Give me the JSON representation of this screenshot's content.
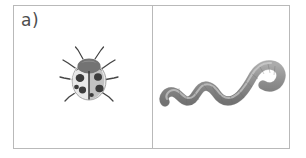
{
  "figure": {
    "label": "a)",
    "background_color": "#ffffff",
    "border_color": "#b9b9b9",
    "label_color": "#4d4d4d"
  },
  "cells": [
    {
      "id": "cell-ladybug",
      "label": "a)",
      "illustration": {
        "name": "ladybug-illustration",
        "subject": "ladybug",
        "style": "grayscale",
        "body_color": "#e6e6e6",
        "shade_color": "#a8a8a8",
        "head_color": "#6b6b6b",
        "spot_color": "#3d3d3d",
        "leg_color": "#4a4a4a",
        "spot_count": 6
      }
    },
    {
      "id": "cell-worm",
      "label": "",
      "illustration": {
        "name": "earthworm-illustration",
        "subject": "earthworm",
        "style": "grayscale",
        "body_color": "#9a9a9a",
        "shade_color": "#787878",
        "highlight_color": "#c4c4c4",
        "outline_color": "#6e6e6e"
      }
    }
  ]
}
